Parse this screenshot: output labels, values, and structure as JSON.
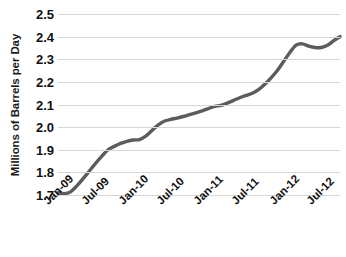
{
  "chart_data": {
    "type": "line",
    "title": "",
    "subtitle": "",
    "xlabel": "",
    "ylabel": "Millions of Barrels per Day",
    "ylim": [
      1.7,
      2.5
    ],
    "ytick_labels": [
      "2.5",
      "2.4",
      "2.3",
      "2.2",
      "2.1",
      "2.0",
      "1.9",
      "1.8",
      "1.7"
    ],
    "ytick_values": [
      2.5,
      2.4,
      2.3,
      2.2,
      2.1,
      2.0,
      1.9,
      1.8,
      1.7
    ],
    "grid": true,
    "legend": false,
    "legend_position": "none",
    "line_color": "#5c5c5c",
    "gridline_color": "#d6d6d6",
    "text_color": "#111111",
    "categories": [
      "Jan-09",
      "Feb-09",
      "Mar-09",
      "Apr-09",
      "May-09",
      "Jun-09",
      "Jul-09",
      "Aug-09",
      "Sep-09",
      "Oct-09",
      "Nov-09",
      "Dec-09",
      "Jan-10",
      "Feb-10",
      "Mar-10",
      "Apr-10",
      "May-10",
      "Jun-10",
      "Jul-10",
      "Aug-10",
      "Sep-10",
      "Oct-10",
      "Nov-10",
      "Dec-10",
      "Jan-11",
      "Feb-11",
      "Mar-11",
      "Apr-11",
      "May-11",
      "Jun-11",
      "Jul-11",
      "Aug-11",
      "Sep-11",
      "Oct-11",
      "Nov-11",
      "Dec-11",
      "Jan-12",
      "Feb-12",
      "Mar-12",
      "Apr-12",
      "May-12",
      "Jun-12",
      "Jul-12",
      "Aug-12",
      "Sep-12",
      "Oct-12"
    ],
    "xtick_labels": [
      "Jan-09",
      "Jul-09",
      "Jan-10",
      "Jul-10",
      "Jan-11",
      "Jul-11",
      "Jan-12",
      "Jul-12"
    ],
    "xtick_indices": [
      0,
      6,
      12,
      18,
      24,
      30,
      36,
      42
    ],
    "values": [
      1.71,
      1.706,
      1.714,
      1.74,
      1.772,
      1.806,
      1.84,
      1.872,
      1.9,
      1.915,
      1.928,
      1.937,
      1.943,
      1.945,
      1.96,
      1.985,
      2.01,
      2.027,
      2.034,
      2.04,
      2.047,
      2.055,
      2.063,
      2.072,
      2.082,
      2.092,
      2.096,
      2.106,
      2.118,
      2.13,
      2.14,
      2.15,
      2.166,
      2.19,
      2.218,
      2.25,
      2.29,
      2.33,
      2.362,
      2.368,
      2.358,
      2.352,
      2.352,
      2.362,
      2.382,
      2.4
    ]
  }
}
